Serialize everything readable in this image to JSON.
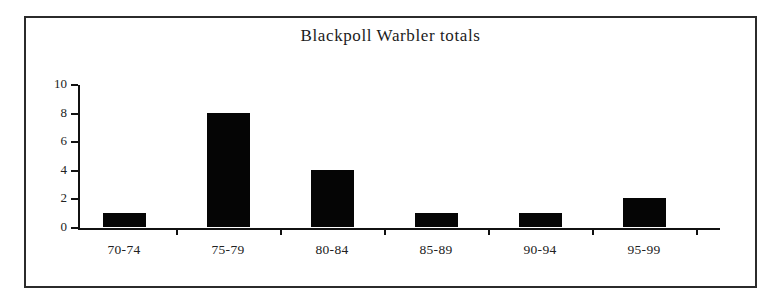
{
  "figure": {
    "background_color": "#ffffff",
    "frame_color": "#2b2b2b",
    "bar_color": "#050505",
    "axis_color": "#111111"
  },
  "chart_data": {
    "type": "bar",
    "title": "Blackpoll Warbler totals",
    "xlabel": "",
    "ylabel": "",
    "categories": [
      "70-74",
      "75-79",
      "80-84",
      "85-89",
      "90-94",
      "95-99"
    ],
    "values": [
      1,
      8,
      4,
      1,
      1,
      2
    ],
    "ylim": [
      0,
      10
    ],
    "ytick_labels": [
      "0",
      "2",
      "4",
      "6",
      "8",
      "10"
    ],
    "ytick_values": [
      0,
      2,
      4,
      6,
      8,
      10
    ],
    "grid": false,
    "legend": null,
    "series": [
      {
        "name": "Blackpoll Warbler totals",
        "values": [
          1,
          8,
          4,
          1,
          1,
          2
        ]
      }
    ]
  }
}
